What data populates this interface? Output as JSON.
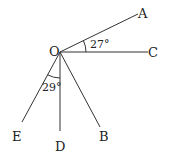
{
  "diagram": {
    "points": {
      "O": "O",
      "A": "A",
      "B": "B",
      "C": "C",
      "D": "D",
      "E": "E"
    },
    "rays": [
      "OA",
      "OC",
      "OB",
      "OD",
      "OE"
    ],
    "angles": [
      {
        "between": "AOC",
        "label": "27°"
      },
      {
        "between": "EOD",
        "label": "29°"
      }
    ]
  }
}
